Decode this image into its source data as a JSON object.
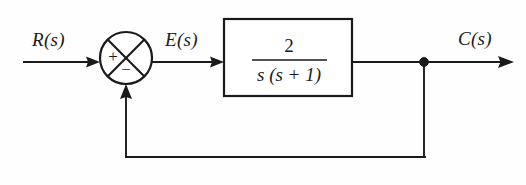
{
  "diagram": {
    "kind": "control-system-block-diagram",
    "background_color": "#fefefe",
    "line_color": "#1a1a1a",
    "input": {
      "label": "R(s)",
      "name": "reference-input"
    },
    "error": {
      "label": "E(s)",
      "name": "error-signal"
    },
    "output": {
      "label": "C(s)",
      "name": "controlled-output"
    },
    "summing_junction": {
      "name": "summing-junction",
      "positive_sign": "+",
      "negative_sign": "−",
      "style": "circle-with-diagonal-cross"
    },
    "plant_block": {
      "name": "transfer-function-block",
      "numerator": "2",
      "denominator": "s (s + 1)",
      "transfer_function": "2 / [s (s + 1)]"
    },
    "feedback": {
      "name": "unity-feedback-path",
      "gain": "1",
      "type": "unity-negative-feedback"
    },
    "takeoff_node": {
      "name": "output-takeoff-node"
    }
  }
}
